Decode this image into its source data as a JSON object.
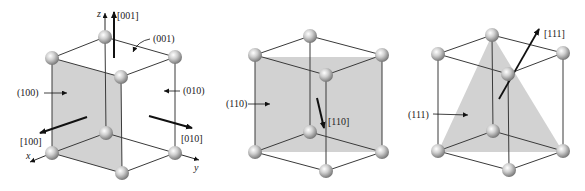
{
  "colors": {
    "plane_fill": "#d2d2d2",
    "edge": "#3a3a3a",
    "arrow": "#111111",
    "label": "#222222"
  },
  "cube1": {
    "axes": {
      "x": "x",
      "y": "y",
      "z": "z"
    },
    "planes": [
      {
        "label": "(100)"
      },
      {
        "label": "(010)"
      },
      {
        "label": "(001)"
      }
    ],
    "directions": [
      {
        "label": "[100]"
      },
      {
        "label": "[010]"
      },
      {
        "label": "[001]"
      }
    ]
  },
  "cube2": {
    "plane": {
      "label": "(110)"
    },
    "direction": {
      "label": "[110]"
    }
  },
  "cube3": {
    "plane": {
      "label": "(111)"
    },
    "direction": {
      "label": "[111]"
    }
  }
}
